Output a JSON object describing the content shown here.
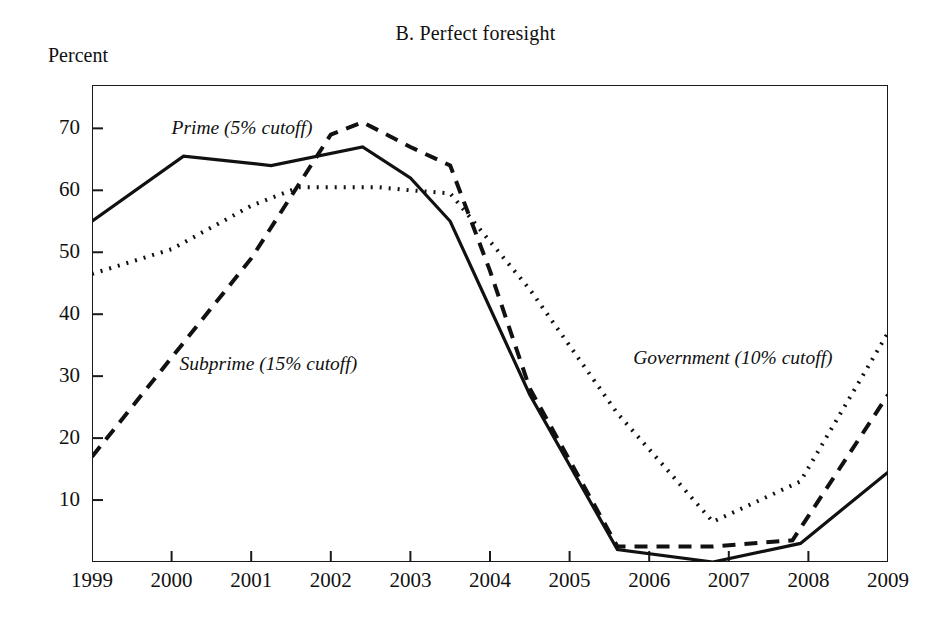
{
  "figure": {
    "panel_title": "B. Perfect foresight",
    "y_axis_unit": "Percent"
  },
  "chart_data": {
    "type": "line",
    "title": "B. Perfect foresight",
    "xlabel": "",
    "ylabel": "Percent",
    "ylim": [
      0,
      77
    ],
    "xlim": [
      1999,
      2009
    ],
    "grid": false,
    "legend": "inline-annotations",
    "yticks": [
      10,
      20,
      30,
      40,
      50,
      60,
      70
    ],
    "xticks": [
      1999,
      2000,
      2001,
      2002,
      2003,
      2004,
      2005,
      2006,
      2007,
      2008,
      2009
    ],
    "series": [
      {
        "name": "Prime (5% cutoff)",
        "style": "solid",
        "x": [
          1999.0,
          2000.15,
          2001.25,
          2002.4,
          2003.0,
          2003.5,
          2004.5,
          2005.6,
          2006.8,
          2007.9,
          2009.0
        ],
        "values": [
          55,
          65.5,
          64,
          67,
          62,
          55,
          27,
          2,
          0,
          3,
          14.5
        ]
      },
      {
        "name": "Subprime (15% cutoff)",
        "style": "dashed",
        "x": [
          1999.0,
          2000.0,
          2001.0,
          2002.0,
          2002.4,
          2003.0,
          2003.5,
          2004.0,
          2004.5,
          2005.6,
          2006.8,
          2007.8,
          2009.0
        ],
        "values": [
          17,
          33,
          49,
          69,
          71,
          67,
          64,
          47,
          28,
          2.5,
          2.5,
          3.5,
          27
        ]
      },
      {
        "name": "Government (10% cutoff)",
        "style": "dotted",
        "x": [
          1999.0,
          2000.0,
          2001.0,
          2001.6,
          2002.6,
          2003.0,
          2003.5,
          2004.5,
          2005.6,
          2006.8,
          2007.9,
          2009.0
        ],
        "values": [
          46.5,
          50.5,
          57.5,
          60.5,
          60.5,
          60,
          59.5,
          44,
          24,
          6.5,
          13,
          37
        ]
      }
    ],
    "annotations": [
      {
        "text": "Prime (5% cutoff)",
        "x": 2000.0,
        "y": 69.5
      },
      {
        "text": "Subprime (15% cutoff)",
        "x": 2000.1,
        "y": 31.5
      },
      {
        "text": "Government (10% cutoff)",
        "x": 2005.8,
        "y": 32.5
      }
    ]
  },
  "y_tick_labels": [
    "70",
    "60",
    "50",
    "40",
    "30",
    "20",
    "10"
  ],
  "x_tick_labels": [
    "1999",
    "2000",
    "2001",
    "2002",
    "2003",
    "2004",
    "2005",
    "2006",
    "2007",
    "2008",
    "2009"
  ],
  "annotation_labels": {
    "prime": "Prime (5% cutoff)",
    "subprime": "Subprime (15% cutoff)",
    "government": "Government (10% cutoff)"
  },
  "colors": {
    "ink": "#111111",
    "background": "#ffffff"
  }
}
